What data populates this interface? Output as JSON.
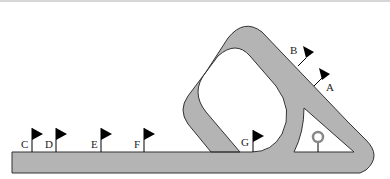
{
  "diagram": {
    "type": "track-layout",
    "colors": {
      "track": "#b4b4b4",
      "track_outline": "#333333",
      "flag": "#000000",
      "background": "#ffffff",
      "marker": "#888888"
    },
    "flags": [
      {
        "id": "A",
        "label": "A"
      },
      {
        "id": "B",
        "label": "B"
      },
      {
        "id": "C",
        "label": "C"
      },
      {
        "id": "D",
        "label": "D"
      },
      {
        "id": "E",
        "label": "E"
      },
      {
        "id": "F",
        "label": "F"
      },
      {
        "id": "G",
        "label": "G"
      }
    ],
    "marker": {
      "name": "ring-post",
      "label": ""
    }
  }
}
